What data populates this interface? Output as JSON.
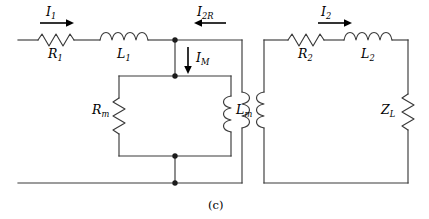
{
  "figure": {
    "caption": "(c)"
  },
  "colors": {
    "wire": "#3a3a3a",
    "node": "#1c1c1c",
    "arrow": "#000000",
    "background": "#ffffff"
  },
  "components": {
    "r1": {
      "symbol": "R",
      "subscript": "1",
      "type": "resistor"
    },
    "l1": {
      "symbol": "L",
      "subscript": "1",
      "type": "inductor"
    },
    "rm": {
      "symbol": "R",
      "subscript": "m",
      "type": "resistor"
    },
    "lm": {
      "symbol": "L",
      "subscript": "m",
      "type": "inductor"
    },
    "r2": {
      "symbol": "R",
      "subscript": "2",
      "type": "resistor"
    },
    "l2": {
      "symbol": "L",
      "subscript": "2",
      "type": "inductor"
    },
    "zl": {
      "symbol": "Z",
      "subscript": "L",
      "type": "impedance"
    },
    "coil_primary": {
      "symbol": "",
      "subscript": "",
      "type": "transformer-coil"
    },
    "coil_secondary": {
      "symbol": "",
      "subscript": "",
      "type": "transformer-coil"
    }
  },
  "currents": {
    "i1": {
      "symbol": "I",
      "subscript": "1",
      "direction": "right"
    },
    "i2r": {
      "symbol": "I",
      "subscript": "2R",
      "direction": "left"
    },
    "im": {
      "symbol": "I",
      "subscript": "M",
      "direction": "down"
    },
    "i2": {
      "symbol": "I",
      "subscript": "2",
      "direction": "right"
    }
  }
}
